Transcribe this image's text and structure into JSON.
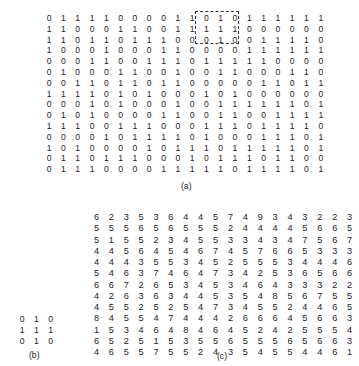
{
  "figure": {
    "a": {
      "caption": "(a)",
      "rows": [
        "0 1 1 1 1 0 0 0 0 1 1 0 1 0 1 1 1 1 1 1",
        "1 1 0 0 0 1 1 0 0 1 1 1 1 1 0 0 0 0 0 0",
        "1 1 0 1 1 0 1 1 1 0 0 0 1 0 0 1 1 1 1 0",
        "1 0 0 0 1 0 0 0 1 1 0 0 0 0 1 1 1 1 1 1",
        "0 0 0 1 1 0 0 1 1 1 0 1 1 1 1 1 0 0 0 0",
        "0 1 0 0 0 1 1 0 0 1 0 0 1 1 0 0 0 1 1 0",
        "0 0 1 1 0 1 1 0 1 1 0 0 0 0 0 1 1 0 1 1",
        "1 1 1 1 0 1 0 1 0 0 0 1 0 1 0 0 0 0 0 0",
        "0 0 0 1 0 1 0 0 0 1 0 0 1 1 1 1 1 1 0 1",
        "0 1 0 1 0 0 0 0 1 1 0 0 1 1 0 0 1 1 1 1",
        "1 1 1 0 0 1 1 1 0 0 0 1 1 1 0 1 1 1 1 0",
        "0 0 0 0 1 0 1 1 1 1 0 1 0 0 0 1 1 1 0 1",
        "1 0 1 0 0 0 0 1 0 1 1 1 0 1 1 1 1 1 0 1",
        "0 1 1 0 1 1 1 0 0 0 1 0 1 1 1 0 1 1 0 0",
        "0 1 1 1 0 0 0 0 1 1 1 1 1 0 1 1 1 1 0 1"
      ]
    },
    "b": {
      "caption": "(b)",
      "rows": [
        "0 1 0",
        "1 1 1",
        "0 1 0"
      ]
    },
    "c": {
      "caption": "(c)",
      "rows": [
        "6 2 3 5 3 6 4 4 5 7 4 9 3 4 3 2 2 3",
        "5 5 5 6 5 6 5 5 5 2 4 4 4 4 5 6 6 5",
        "5 1 5 5 2 3 4 5 5 3 3 4 3 4 7 5 6 7",
        "4 4 5 6 4 5 4 6 7 4 5 7 6 6 5 3 3 3",
        "4 4 4 3 5 5 3 4 5 2 5 5 5 3 4 4 4 6",
        "5 4 6 3 7 4 6 4 7 3 4 2 5 3 6 5 6 6",
        "6 6 7 2 6 5 3 4 5 3 4 6 4 3 3 3 2 2",
        "4 2 6 3 6 3 4 4 5 3 5 4 8 5 6 7 5 5",
        "4 5 5 2 5 2 5 4 7 3 4 5 5 2 4 4 6 5",
        "8 4 5 5 4 7 4 4 4 2 6 6 6 4 5 6 6 3",
        "1 5 3 4 6 4 8 4 6 4 5 2 4 2 5 5 5 4",
        "6 5 2 5 1 5 3 5 5 6 5 5 5 6 5 6 6 3",
        "4 6 5 5 7 5 5 2 4 3 5 4 5 5 4 4 6 1"
      ]
    }
  }
}
